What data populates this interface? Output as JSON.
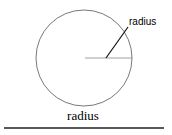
{
  "diagram": {
    "label": "radius",
    "circle": {
      "cx": 84,
      "cy": 58,
      "r": 48,
      "stroke": "#555555"
    },
    "radius_line": {
      "x1": 106,
      "y1": 58,
      "x2": 128,
      "y2": 27,
      "stroke": "#111111"
    },
    "horizontal_line": {
      "x1": 85,
      "y1": 58,
      "x2": 132,
      "y2": 58,
      "stroke": "#888888"
    }
  },
  "caption": "radius",
  "underline": {
    "x1": 4,
    "y1": 128,
    "x2": 164,
    "y2": 128,
    "stroke": "#222222"
  }
}
